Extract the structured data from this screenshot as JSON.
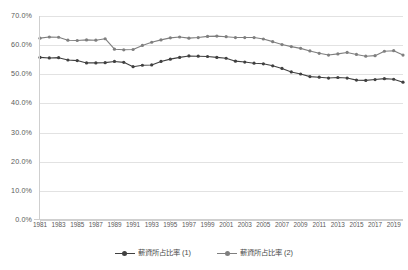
{
  "chart_data": {
    "type": "line",
    "title": "",
    "subtitle": "",
    "xlabel": "",
    "ylabel": "",
    "ylim": [
      0,
      70
    ],
    "y_ticks": [
      "0.0%",
      "10.0%",
      "20.0%",
      "30.0%",
      "40.0%",
      "50.0%",
      "60.0%",
      "70.0%"
    ],
    "y_tick_values": [
      0,
      10,
      20,
      30,
      40,
      50,
      60,
      70
    ],
    "grid": "horizontal",
    "legend_position": "bottom",
    "x": [
      1981,
      1982,
      1983,
      1984,
      1985,
      1986,
      1987,
      1988,
      1989,
      1990,
      1991,
      1992,
      1993,
      1994,
      1995,
      1996,
      1997,
      1998,
      1999,
      2000,
      2001,
      2002,
      2003,
      2004,
      2005,
      2006,
      2007,
      2008,
      2009,
      2010,
      2011,
      2012,
      2013,
      2014,
      2015,
      2016,
      2017,
      2018,
      2019,
      2020
    ],
    "x_tick_labels": [
      "1981",
      "1983",
      "1985",
      "1987",
      "1989",
      "1991",
      "1993",
      "1995",
      "1997",
      "1999",
      "2001",
      "2003",
      "2005",
      "2007",
      "2009",
      "2011",
      "2013",
      "2015",
      "2017",
      "2019"
    ],
    "series": [
      {
        "name": "薪資所占比率 (1)",
        "color": "#404040",
        "values": [
          55.8,
          55.6,
          55.7,
          54.9,
          54.7,
          53.9,
          53.9,
          54.0,
          54.4,
          54.1,
          52.6,
          53.1,
          53.2,
          54.4,
          55.2,
          55.8,
          56.3,
          56.2,
          56.1,
          55.8,
          55.5,
          54.5,
          54.2,
          53.8,
          53.6,
          52.9,
          52.0,
          50.8,
          50.1,
          49.2,
          49.0,
          48.7,
          48.9,
          48.7,
          48.0,
          47.9,
          48.2,
          48.5,
          48.3,
          47.3
        ]
      },
      {
        "name": "薪資所占比率 (2)",
        "color": "#7f7f7f",
        "values": [
          62.4,
          62.8,
          62.7,
          61.7,
          61.6,
          61.8,
          61.7,
          62.2,
          58.6,
          58.4,
          58.5,
          59.9,
          61.0,
          61.8,
          62.5,
          62.8,
          62.4,
          62.6,
          63.0,
          63.1,
          62.9,
          62.6,
          62.6,
          62.6,
          62.1,
          61.2,
          60.2,
          59.5,
          58.9,
          58.0,
          57.2,
          56.6,
          57.0,
          57.5,
          56.8,
          56.2,
          56.4,
          57.9,
          58.1,
          56.6
        ]
      }
    ]
  },
  "legend": {
    "items": [
      {
        "label": "薪資所占比率 (1)",
        "color": "#404040"
      },
      {
        "label": "薪資所占比率 (2)",
        "color": "#7f7f7f"
      }
    ]
  }
}
